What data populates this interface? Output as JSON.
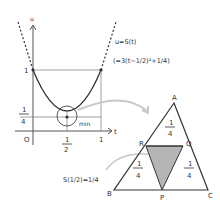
{
  "graph": {
    "axis_u": "u",
    "axis_t": "t",
    "origin": "O",
    "y_tick_1": "1",
    "y_tick_quarter_num": "1",
    "y_tick_quarter_den": "4",
    "x_tick_half_num": "1",
    "x_tick_half_den": "2",
    "x_tick_1": "1",
    "min_label": "min",
    "equation": "u=S(t)",
    "equation_expanded": "(=3(t−1/2)²+1/4)"
  },
  "triangle": {
    "vertices": [
      "A",
      "B",
      "C"
    ],
    "points": [
      "P",
      "Q",
      "R"
    ],
    "area_num": "1",
    "area_den": "4",
    "result_label": "S(1/2)=1/4"
  },
  "colors": {
    "line": "#333333",
    "shade": "#b5b5b5",
    "arrow": "#c8c8c8"
  }
}
